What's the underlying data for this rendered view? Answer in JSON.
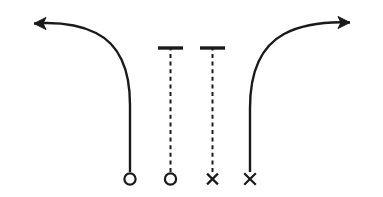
{
  "diagram": {
    "type": "sports-play-diagram",
    "canvas": {
      "width": 383,
      "height": 197,
      "background": "#ffffff"
    },
    "style": {
      "stroke_color": "#1a1a1a",
      "route_stroke_width": 2.4,
      "stem_stroke_width": 2.2,
      "dash_stroke_width": 2.0,
      "marker_stroke_width": 2.2,
      "dash_pattern": "4 3.6"
    },
    "elements": [
      {
        "id": "left-out-route",
        "name": "left-curved-arrow-route",
        "label": "Left curved route with arrowhead",
        "line_style": "solid",
        "has_arrowhead": true,
        "arrow_direction": "left",
        "arrow_tip": {
          "x": 24,
          "y": 23.5
        },
        "origin_marker": "circle",
        "origin": {
          "x": 130,
          "y": 179
        },
        "path": "M 130 172 L 130 105 C 130 70 120 45 96 33 C 78 24 56 22 34 23.5",
        "arrowhead_points": "34,23.5 46,17.5 43,23.5 46,29.5"
      },
      {
        "id": "left-dashed-stem",
        "name": "left-dashed-blocking-line",
        "label": "Left dashed line with top cap bar",
        "line_style": "dashed",
        "has_arrowhead": false,
        "has_cap_bar": true,
        "cap_bar": {
          "x1": 158,
          "x2": 183,
          "y": 48
        },
        "origin_marker": "circle",
        "origin": {
          "x": 170.5,
          "y": 179
        },
        "path": "M 170.5 172 L 170.5 49"
      },
      {
        "id": "right-dashed-stem",
        "name": "right-dashed-blocking-line",
        "label": "Right dashed line with top cap bar",
        "line_style": "dashed",
        "has_arrowhead": false,
        "has_cap_bar": true,
        "cap_bar": {
          "x1": 200,
          "x2": 225,
          "y": 48
        },
        "origin_marker": "cross",
        "origin": {
          "x": 212.5,
          "y": 179
        },
        "path": "M 212.5 172 L 212.5 49"
      },
      {
        "id": "right-out-route",
        "name": "right-curved-arrow-route",
        "label": "Right curved route with arrowhead",
        "line_style": "solid",
        "has_arrowhead": true,
        "arrow_direction": "right",
        "arrow_tip": {
          "x": 360,
          "y": 22.5
        },
        "origin_marker": "cross",
        "origin": {
          "x": 250,
          "y": 179
        },
        "path": "M 250 172 L 250 108 C 250 72 260 47 284 34 C 303 24 327 21.5 350 22.5",
        "arrowhead_points": "350,22.5 338,16.5 341,22.5 338,28.5"
      }
    ],
    "markers": [
      {
        "id": "marker-1",
        "name": "circle-marker-left",
        "shape": "circle",
        "cx": 130,
        "cy": 179,
        "r": 5.6
      },
      {
        "id": "marker-2",
        "name": "circle-marker-second",
        "shape": "circle",
        "cx": 170.5,
        "cy": 179,
        "r": 5.6
      },
      {
        "id": "marker-3",
        "name": "cross-marker-third",
        "shape": "cross",
        "cx": 212.5,
        "cy": 179,
        "size": 5.4
      },
      {
        "id": "marker-4",
        "name": "cross-marker-right",
        "shape": "cross",
        "cx": 250,
        "cy": 179,
        "size": 5.8
      }
    ]
  }
}
